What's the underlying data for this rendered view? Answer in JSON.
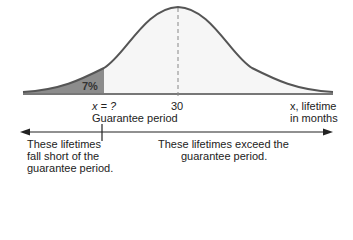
{
  "diagram": {
    "type": "normal-distribution-guarantee",
    "shaded_label": "7%",
    "x_label_left": "x = ?",
    "x_label_left_sub": "Guarantee period",
    "x_label_mean": "30",
    "axis_label_line1": "x, lifetime",
    "axis_label_line2": "in months",
    "left_region_text": [
      "These lifetimes",
      "fall short of the",
      "guarantee period."
    ],
    "right_region_text": [
      "These lifetimes exceed the",
      "guarantee period."
    ],
    "colors": {
      "curve": "#555555",
      "shaded": "#8c8c8c",
      "unshaded_fill": "#f6f6f6",
      "axis": "#777777",
      "arrow": "#222222"
    }
  }
}
